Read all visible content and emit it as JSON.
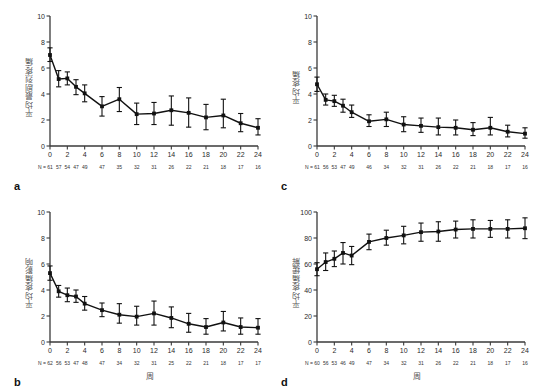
{
  "figure": {
    "panels": [
      {
        "letter": "a",
        "ylabel": "平均最剧烈疼痛",
        "xlabel": "",
        "n_prefix": "N =",
        "chart_index": 0
      },
      {
        "letter": "b",
        "ylabel": "平均疼痛影响",
        "xlabel": "周",
        "n_prefix": "N =",
        "chart_index": 1
      },
      {
        "letter": "c",
        "ylabel": "平均疼痛",
        "xlabel": "",
        "n_prefix": "N =",
        "chart_index": 2
      },
      {
        "letter": "d",
        "ylabel": "平均疼痛缓解",
        "xlabel": "周",
        "n_prefix": "N =",
        "chart_index": 3
      }
    ]
  },
  "chart_data": [
    {
      "type": "line",
      "panel": "a",
      "title": "",
      "xlabel": "",
      "ylabel": "平均最剧烈疼痛",
      "xlim": [
        0,
        24
      ],
      "ylim": [
        0,
        10
      ],
      "xticks": [
        0,
        2,
        4,
        6,
        8,
        10,
        12,
        14,
        16,
        18,
        20,
        22,
        24
      ],
      "yticks": [
        0,
        2,
        4,
        6,
        8,
        10
      ],
      "grid": false,
      "legend": "none",
      "error_bars": "mean ± 95% CI",
      "x": [
        0,
        1,
        2,
        3,
        4,
        6,
        8,
        10,
        12,
        14,
        16,
        18,
        20,
        22,
        24
      ],
      "values": [
        7.0,
        5.15,
        5.2,
        4.55,
        4.05,
        3.05,
        3.6,
        2.45,
        2.5,
        2.75,
        2.55,
        2.2,
        2.35,
        1.75,
        1.4
      ],
      "err_low": [
        6.5,
        4.55,
        4.7,
        3.95,
        3.4,
        2.3,
        2.65,
        1.65,
        1.65,
        1.6,
        1.45,
        1.25,
        1.4,
        1.1,
        0.85
      ],
      "err_high": [
        7.55,
        5.8,
        5.7,
        5.1,
        4.7,
        3.8,
        4.5,
        3.3,
        3.35,
        3.85,
        3.7,
        3.2,
        3.6,
        2.5,
        2.1
      ],
      "n_labels": [
        "61",
        "57",
        "54",
        "47",
        "49",
        "47",
        "35",
        "32",
        "31",
        "26",
        "22",
        "21",
        "18",
        "17",
        "16"
      ]
    },
    {
      "type": "line",
      "panel": "b",
      "title": "",
      "xlabel": "周",
      "ylabel": "平均疼痛影响",
      "xlim": [
        0,
        24
      ],
      "ylim": [
        0,
        10
      ],
      "xticks": [
        0,
        2,
        4,
        6,
        8,
        10,
        12,
        14,
        16,
        18,
        20,
        22,
        24
      ],
      "yticks": [
        0,
        2,
        4,
        6,
        8,
        10
      ],
      "grid": false,
      "legend": "none",
      "error_bars": "mean ± 95% CI",
      "x": [
        0,
        1,
        2,
        3,
        4,
        6,
        8,
        10,
        12,
        14,
        16,
        18,
        20,
        22,
        24
      ],
      "values": [
        5.3,
        3.9,
        3.6,
        3.5,
        2.95,
        2.45,
        2.1,
        1.95,
        2.2,
        1.85,
        1.4,
        1.15,
        1.5,
        1.15,
        1.1
      ],
      "err_low": [
        4.75,
        3.45,
        3.1,
        3.05,
        2.45,
        1.95,
        1.45,
        1.3,
        1.3,
        1.1,
        0.75,
        0.6,
        0.85,
        0.6,
        0.6
      ],
      "err_high": [
        5.85,
        4.35,
        4.15,
        4.0,
        3.5,
        3.0,
        2.95,
        2.75,
        3.15,
        2.7,
        2.2,
        1.8,
        2.35,
        1.85,
        1.8
      ],
      "n_labels": [
        "62",
        "56",
        "53",
        "47",
        "48",
        "47",
        "34",
        "32",
        "31",
        "25",
        "22",
        "21",
        "18",
        "17",
        "17"
      ]
    },
    {
      "type": "line",
      "panel": "c",
      "title": "",
      "xlabel": "",
      "ylabel": "平均疼痛",
      "xlim": [
        0,
        24
      ],
      "ylim": [
        0,
        10
      ],
      "xticks": [
        0,
        2,
        4,
        6,
        8,
        10,
        12,
        14,
        16,
        18,
        20,
        22,
        24
      ],
      "yticks": [
        0,
        2,
        4,
        6,
        8,
        10
      ],
      "grid": false,
      "legend": "none",
      "error_bars": "mean ± 95% CI",
      "x": [
        0,
        1,
        2,
        3,
        4,
        6,
        8,
        10,
        12,
        14,
        16,
        18,
        20,
        22,
        24
      ],
      "values": [
        4.75,
        3.55,
        3.45,
        3.1,
        2.6,
        1.9,
        2.05,
        1.65,
        1.55,
        1.45,
        1.4,
        1.25,
        1.4,
        1.1,
        0.95
      ],
      "err_low": [
        4.2,
        3.15,
        3.05,
        2.6,
        2.2,
        1.5,
        1.5,
        1.1,
        1.05,
        0.85,
        0.85,
        0.8,
        0.85,
        0.7,
        0.6
      ],
      "err_high": [
        5.3,
        4.0,
        3.9,
        3.6,
        3.15,
        2.4,
        2.6,
        2.25,
        2.15,
        2.15,
        2.0,
        1.8,
        2.2,
        1.6,
        1.4
      ],
      "n_labels": [
        "61",
        "56",
        "53",
        "47",
        "49",
        "46",
        "34",
        "32",
        "31",
        "26",
        "22",
        "21",
        "18",
        "17",
        "16"
      ]
    },
    {
      "type": "line",
      "panel": "d",
      "title": "",
      "xlabel": "周",
      "ylabel": "平均疼痛缓解",
      "xlim": [
        0,
        24
      ],
      "ylim": [
        0,
        100
      ],
      "xticks": [
        0,
        2,
        4,
        6,
        8,
        10,
        12,
        14,
        16,
        18,
        20,
        22,
        24
      ],
      "yticks": [
        0,
        20,
        40,
        60,
        80,
        100
      ],
      "grid": false,
      "legend": "none",
      "error_bars": "mean ± 95% CI",
      "x": [
        0,
        1,
        2,
        3,
        4,
        6,
        8,
        10,
        12,
        14,
        16,
        18,
        20,
        22,
        24
      ],
      "values": [
        56,
        61.5,
        64,
        68.5,
        66.5,
        77,
        80,
        82,
        84.5,
        85,
        86.5,
        87,
        87,
        87,
        87.5
      ],
      "err_low": [
        51,
        55,
        58,
        60,
        59.5,
        71,
        74.5,
        75.5,
        77.5,
        77.5,
        80,
        80,
        80.5,
        80,
        79.5
      ],
      "err_high": [
        61,
        68.5,
        70,
        76.5,
        73.5,
        83,
        86,
        89,
        91.5,
        92.5,
        93,
        94,
        93.5,
        94,
        95.5
      ],
      "n_labels": [
        "60",
        "56",
        "53",
        "46",
        "49",
        "47",
        "34",
        "32",
        "31",
        "26",
        "22",
        "21",
        "18",
        "17",
        "16"
      ]
    }
  ]
}
